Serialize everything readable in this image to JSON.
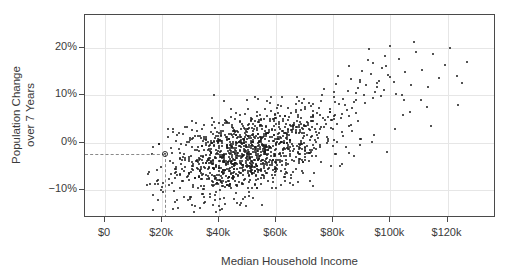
{
  "chart_data": {
    "type": "scatter",
    "title": "",
    "xlabel": "Median Household Income",
    "ylabel": "Population Change\nover 7 Years",
    "ylabel_line1": "Population Change",
    "ylabel_line2": "over 7 Years",
    "xlim": [
      -7000,
      137000
    ],
    "ylim": [
      -16,
      27
    ],
    "xticks": [
      0,
      20000,
      40000,
      60000,
      80000,
      100000,
      120000
    ],
    "xticklabels": [
      "$0",
      "$20k",
      "$40k",
      "$60k",
      "$80k",
      "$100k",
      "$120k"
    ],
    "yticks": [
      -10,
      0,
      10,
      20
    ],
    "yticklabels": [
      "-10%",
      "0%",
      "10%",
      "20%"
    ],
    "grid": true,
    "grid_color": "#e6e6e6",
    "point_color": "#1a1a1a",
    "panel_border_color": "#4a4a4a",
    "background": "#ffffff",
    "annotations": [
      {
        "name": "highlighted-point",
        "x": 21000,
        "y": -2.5,
        "marker": "open-circle",
        "guide_lines": "dashed",
        "guide_color": "#8a8a8a"
      }
    ],
    "n_points": 1100,
    "correlation": "positive",
    "points": [
      [
        18500,
        -12.1
      ],
      [
        20100,
        -9.4
      ],
      [
        21000,
        -2.5
      ],
      [
        19800,
        -5.2
      ],
      [
        22400,
        -7.8
      ],
      [
        23100,
        -1.1
      ],
      [
        24000,
        -4.3
      ],
      [
        22000,
        1.2
      ],
      [
        25100,
        -6.9
      ],
      [
        26200,
        -2.2
      ],
      [
        24800,
        0.4
      ],
      [
        27000,
        -3.8
      ],
      [
        23600,
        -8.5
      ],
      [
        25900,
        2.1
      ],
      [
        28100,
        -5.1
      ],
      [
        26800,
        -0.3
      ],
      [
        29200,
        -7.2
      ],
      [
        27500,
        1.8
      ],
      [
        30100,
        -2.9
      ],
      [
        28600,
        3.2
      ],
      [
        31000,
        -4.6
      ],
      [
        29700,
        0.9
      ],
      [
        32200,
        -1.5
      ],
      [
        30500,
        2.6
      ],
      [
        33100,
        -3.3
      ],
      [
        31800,
        4.1
      ],
      [
        34000,
        -0.8
      ],
      [
        32600,
        1.4
      ],
      [
        35200,
        -5.4
      ],
      [
        33900,
        2.9
      ],
      [
        36100,
        0.2
      ],
      [
        34700,
        3.7
      ],
      [
        37000,
        -2.1
      ],
      [
        35500,
        1.1
      ],
      [
        38200,
        4.4
      ],
      [
        36800,
        -1.8
      ],
      [
        39100,
        2.3
      ],
      [
        37600,
        5.1
      ],
      [
        40000,
        0.6
      ],
      [
        38400,
        3.1
      ],
      [
        41200,
        -3.0
      ],
      [
        39800,
        1.9
      ],
      [
        42100,
        4.8
      ],
      [
        40600,
        2.4
      ],
      [
        43000,
        -1.2
      ],
      [
        41400,
        3.6
      ],
      [
        44200,
        5.4
      ],
      [
        42800,
        0.8
      ],
      [
        45100,
        2.7
      ],
      [
        43600,
        4.2
      ],
      [
        46000,
        -0.5
      ],
      [
        44400,
        3.3
      ],
      [
        47200,
        5.9
      ],
      [
        45800,
        1.6
      ],
      [
        48100,
        3.9
      ],
      [
        46600,
        2.2
      ],
      [
        49000,
        6.1
      ],
      [
        47400,
        4.5
      ],
      [
        50200,
        1.3
      ],
      [
        48800,
        3.0
      ],
      [
        51100,
        5.2
      ],
      [
        49600,
        2.8
      ],
      [
        52000,
        0.1
      ],
      [
        50400,
        4.0
      ],
      [
        53200,
        6.4
      ],
      [
        51800,
        2.5
      ],
      [
        54100,
        4.7
      ],
      [
        52600,
        3.4
      ],
      [
        55000,
        1.0
      ],
      [
        53400,
        5.6
      ],
      [
        56200,
        7.1
      ],
      [
        54800,
        3.8
      ],
      [
        57100,
        2.0
      ],
      [
        55600,
        4.9
      ],
      [
        58000,
        6.6
      ],
      [
        56400,
        1.7
      ],
      [
        59200,
        3.5
      ],
      [
        57800,
        5.0
      ],
      [
        60100,
        7.4
      ],
      [
        58600,
        2.6
      ],
      [
        61000,
        4.3
      ],
      [
        59400,
        6.0
      ],
      [
        62200,
        1.4
      ],
      [
        60800,
        3.2
      ],
      [
        63100,
        5.7
      ],
      [
        61600,
        7.8
      ],
      [
        64000,
        2.9
      ],
      [
        62400,
        4.6
      ],
      [
        65200,
        6.3
      ],
      [
        63800,
        1.5
      ],
      [
        66100,
        3.7
      ],
      [
        64600,
        5.3
      ],
      [
        67000,
        8.1
      ],
      [
        65400,
        2.3
      ],
      [
        68200,
        4.4
      ],
      [
        66800,
        6.9
      ],
      [
        69100,
        3.1
      ],
      [
        67600,
        5.8
      ],
      [
        70000,
        7.6
      ],
      [
        68400,
        2.7
      ],
      [
        71200,
        4.1
      ],
      [
        69800,
        9.2
      ],
      [
        72100,
        5.5
      ],
      [
        70600,
        3.4
      ],
      [
        73000,
        6.7
      ],
      [
        71400,
        8.4
      ],
      [
        74200,
        4.0
      ],
      [
        72800,
        5.9
      ],
      [
        75100,
        7.2
      ],
      [
        73600,
        2.8
      ],
      [
        76000,
        10.1
      ],
      [
        74400,
        6.2
      ],
      [
        77200,
        4.7
      ],
      [
        75800,
        8.8
      ],
      [
        78100,
        5.4
      ],
      [
        76600,
        11.3
      ],
      [
        79000,
        7.0
      ],
      [
        77400,
        3.9
      ],
      [
        80200,
        9.6
      ],
      [
        78800,
        6.5
      ],
      [
        81100,
        12.4
      ],
      [
        79600,
        4.8
      ],
      [
        82000,
        8.2
      ],
      [
        80400,
        10.7
      ],
      [
        83200,
        6.1
      ],
      [
        81800,
        14.1
      ],
      [
        84100,
        7.9
      ],
      [
        82600,
        5.2
      ],
      [
        85000,
        11.0
      ],
      [
        83400,
        9.3
      ],
      [
        86200,
        13.5
      ],
      [
        84800,
        6.8
      ],
      [
        87100,
        8.6
      ],
      [
        85600,
        16.2
      ],
      [
        88000,
        10.4
      ],
      [
        86400,
        7.3
      ],
      [
        89200,
        12.8
      ],
      [
        87800,
        9.0
      ],
      [
        90100,
        15.1
      ],
      [
        88600,
        11.6
      ],
      [
        91000,
        8.3
      ],
      [
        89400,
        13.2
      ],
      [
        92200,
        17.4
      ],
      [
        90800,
        10.0
      ],
      [
        93100,
        14.6
      ],
      [
        91600,
        12.1
      ],
      [
        94000,
        9.5
      ],
      [
        92400,
        19.8
      ],
      [
        95200,
        11.8
      ],
      [
        93800,
        16.9
      ],
      [
        96100,
        13.0
      ],
      [
        94600,
        10.6
      ],
      [
        97000,
        15.7
      ],
      [
        95400,
        12.5
      ],
      [
        98200,
        18.3
      ],
      [
        96800,
        9.8
      ],
      [
        99100,
        14.2
      ],
      [
        97600,
        11.2
      ],
      [
        100000,
        20.4
      ],
      [
        98400,
        16.1
      ],
      [
        101200,
        12.9
      ],
      [
        99800,
        13.8
      ],
      [
        102100,
        10.3
      ],
      [
        103000,
        17.6
      ],
      [
        105200,
        14.9
      ],
      [
        107100,
        12.2
      ],
      [
        109000,
        19.1
      ],
      [
        111200,
        15.3
      ],
      [
        113100,
        11.7
      ],
      [
        115000,
        18.7
      ],
      [
        117200,
        13.6
      ],
      [
        119100,
        16.4
      ],
      [
        121000,
        20.1
      ],
      [
        123200,
        14.0
      ],
      [
        125100,
        12.6
      ],
      [
        127000,
        17.0
      ],
      [
        104600,
        8.9
      ],
      [
        106800,
        6.4
      ],
      [
        108400,
        21.2
      ],
      [
        110600,
        9.1
      ],
      [
        112800,
        7.5
      ]
    ]
  }
}
